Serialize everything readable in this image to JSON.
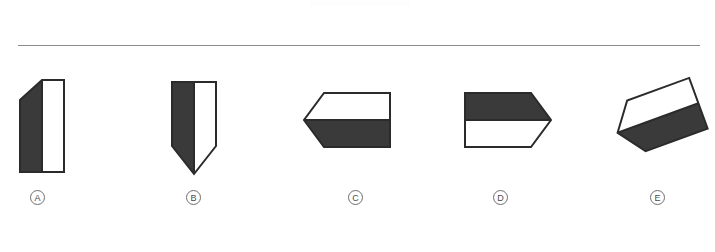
{
  "page": {
    "kind": "multiple-choice-figure-question",
    "background_color": "#ffffff",
    "divider_color": "#8c8c8c"
  },
  "style": {
    "fill_dark": "#3a3a3a",
    "fill_light": "#ffffff",
    "stroke": "#2b2b2b",
    "label_text_color": "#4a4a4a",
    "label_border_color": "#6e6e6e"
  },
  "options": [
    {
      "id": "A",
      "label": "A",
      "description": "upward-pointing house pentagon, left half dark, right half white",
      "orientation": "point-up",
      "dark_region": "left",
      "outline": "30,8 52,8 52,100 8,100 8,28",
      "dark_path": "30,8 30,100 8,100 8,28",
      "light_path": "30,8 52,8 52,100 30,100"
    },
    {
      "id": "B",
      "label": "B",
      "description": "downward-pointing shield pentagon, left half dark, right half white",
      "orientation": "point-down",
      "dark_region": "left",
      "outline": "8,8 52,8 52,72 30,100 8,72",
      "dark_path": "8,8 30,8 30,100 8,72",
      "light_path": "30,8 52,8 52,72 30,100"
    },
    {
      "id": "C",
      "label": "C",
      "description": "left-pointing arrow pentagon, top half white, bottom half dark",
      "orientation": "point-left",
      "dark_region": "bottom",
      "outline": "22,12 88,12 88,66 22,66 2,39",
      "dark_path": "2,39 22,66 88,66 88,39",
      "light_path": "22,12 88,12 88,39 2,39"
    },
    {
      "id": "D",
      "label": "D",
      "description": "right-pointing arrow pentagon, top half dark, bottom half white",
      "orientation": "point-right",
      "dark_region": "top",
      "outline": "2,12 68,12 88,39 68,66 2,66",
      "dark_path": "2,12 68,12 88,39 2,39",
      "light_path": "2,39 88,39 68,66 2,66"
    },
    {
      "id": "E",
      "label": "E",
      "description": "rotated right-pointing arrow pentagon, upper band dark, lower band white",
      "orientation": "rotated",
      "rotation_degrees": 160,
      "dark_region": "top",
      "outline": "2,12 68,12 88,39 68,66 2,66",
      "dark_path": "2,12 68,12 88,39 2,39",
      "light_path": "2,39 88,39 68,66 2,66"
    }
  ]
}
